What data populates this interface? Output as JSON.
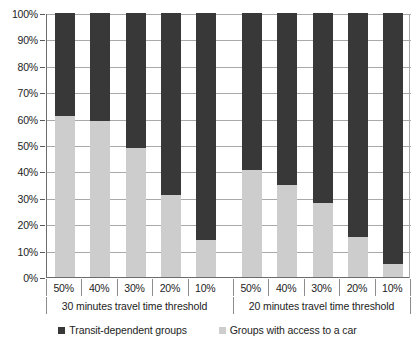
{
  "chart_data": {
    "type": "bar",
    "title": "",
    "subtitle": "",
    "xlabel": "",
    "ylabel": "",
    "stacked": true,
    "stack_total": 100,
    "grid": true,
    "legend_position": "bottom",
    "ylim": [
      0,
      100
    ],
    "y_ticks": [
      "0%",
      "10%",
      "20%",
      "30%",
      "40%",
      "50%",
      "60%",
      "70%",
      "80%",
      "90%",
      "100%"
    ],
    "y_tick_values": [
      0,
      10,
      20,
      30,
      40,
      50,
      60,
      70,
      80,
      90,
      100
    ],
    "categories": [
      "50%",
      "40%",
      "30%",
      "20%",
      "10%",
      "50%",
      "40%",
      "30%",
      "20%",
      "10%"
    ],
    "groups": [
      {
        "label": "30 minutes travel time threshold",
        "categories": [
          "50%",
          "40%",
          "30%",
          "20%",
          "10%"
        ]
      },
      {
        "label": "20 minutes travel time threshold",
        "categories": [
          "50%",
          "40%",
          "30%",
          "20%",
          "10%"
        ]
      }
    ],
    "series": [
      {
        "name": "Groups with access to a car",
        "color": "#cdcdcd",
        "values": [
          61,
          59,
          49,
          31,
          14,
          40.5,
          35,
          28,
          15,
          5
        ]
      },
      {
        "name": "Transit-dependent groups",
        "color": "#383838",
        "values": [
          39,
          41,
          51,
          69,
          86,
          59.5,
          65,
          72,
          85,
          95
        ]
      }
    ],
    "legend": [
      {
        "label": "Transit-dependent groups",
        "color": "#383838",
        "marker": "square"
      },
      {
        "label": "Groups with access to a car",
        "color": "#cdcdcd",
        "marker": "square"
      }
    ]
  }
}
